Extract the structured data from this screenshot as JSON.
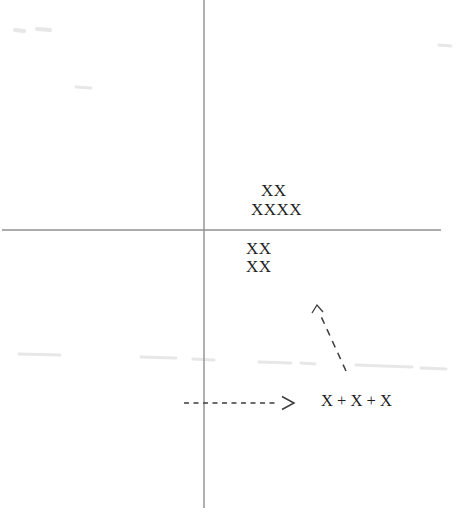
{
  "figure": {
    "background": "#ffffff",
    "ink_color": "#1f1f1f",
    "axis_color": "#8f8f8f",
    "arrow_color": "#3d3d3d",
    "smudge_color": "#e7e7e7",
    "labels": {
      "above_axis_row1": "XX",
      "above_axis_row2": "XXXX",
      "below_axis_row1": "XX",
      "below_axis_row2": "XX",
      "expression": "X + X + X"
    },
    "geometry_note": {
      "vertical_axis_x": 204,
      "horizontal_axis_y": 230,
      "dashed_arrow_y": 403
    }
  }
}
